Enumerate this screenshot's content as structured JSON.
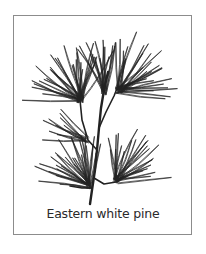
{
  "figure": {
    "caption": "Eastern white pine",
    "frame_color": "#8c8c8c",
    "ink_color": "#222222",
    "background": "#ffffff"
  },
  "drawing": {
    "stem": [
      [
        90,
        204
      ],
      [
        92,
        190
      ],
      [
        95,
        170
      ],
      [
        97,
        150
      ],
      [
        99,
        128
      ],
      [
        101,
        108
      ],
      [
        104,
        90
      ],
      [
        108,
        72
      ]
    ],
    "twigs": [
      [
        [
          97,
          150
        ],
        [
          88,
          140
        ],
        [
          82,
          120
        ],
        [
          80,
          100
        ]
      ],
      [
        [
          99,
          128
        ],
        [
          106,
          112
        ],
        [
          114,
          96
        ],
        [
          118,
          86
        ]
      ],
      [
        [
          92,
          188
        ],
        [
          82,
          188
        ],
        [
          70,
          186
        ]
      ],
      [
        [
          94,
          178
        ],
        [
          104,
          184
        ],
        [
          116,
          182
        ],
        [
          124,
          176
        ]
      ]
    ],
    "clusters": [
      {
        "name": "top-left",
        "cx": 80,
        "cy": 100,
        "count": 30,
        "angle_from": -175,
        "angle_to": -60,
        "len_min": 30,
        "len_max": 58
      },
      {
        "name": "top-center",
        "cx": 104,
        "cy": 92,
        "count": 14,
        "angle_from": -120,
        "angle_to": -70,
        "len_min": 30,
        "len_max": 55
      },
      {
        "name": "top-right",
        "cx": 118,
        "cy": 90,
        "count": 28,
        "angle_from": -90,
        "angle_to": 10,
        "len_min": 30,
        "len_max": 60
      },
      {
        "name": "bottom-left",
        "cx": 88,
        "cy": 186,
        "count": 28,
        "angle_from": -175,
        "angle_to": -75,
        "len_min": 25,
        "len_max": 55
      },
      {
        "name": "bottom-right",
        "cx": 116,
        "cy": 180,
        "count": 24,
        "angle_from": -100,
        "angle_to": -5,
        "len_min": 25,
        "len_max": 55
      },
      {
        "name": "mid-left",
        "cx": 86,
        "cy": 140,
        "count": 10,
        "angle_from": -175,
        "angle_to": -130,
        "len_min": 25,
        "len_max": 45
      }
    ]
  }
}
